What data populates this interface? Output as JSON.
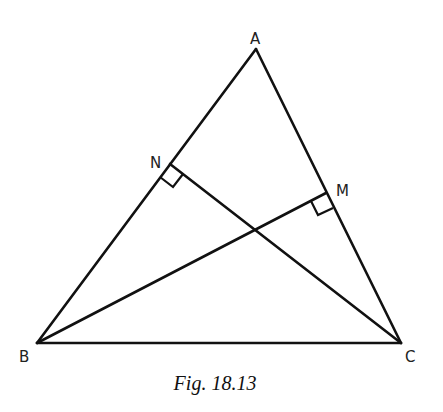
{
  "figure": {
    "caption": "Fig.  18.13",
    "vertices": {
      "A": {
        "label": "A",
        "x": 256,
        "y": 49,
        "lx": 250,
        "ly": 44
      },
      "B": {
        "label": "B",
        "x": 37,
        "y": 343,
        "lx": 19,
        "ly": 362
      },
      "C": {
        "label": "C",
        "x": 401,
        "y": 343,
        "lx": 405,
        "ly": 362
      },
      "N": {
        "label": "N",
        "x": 170,
        "y": 164,
        "lx": 150,
        "ly": 168
      },
      "M": {
        "label": "M",
        "x": 326,
        "y": 193,
        "lx": 336,
        "ly": 196
      }
    },
    "segments": [
      {
        "name": "AB",
        "from": "A",
        "to": "B"
      },
      {
        "name": "AC",
        "from": "A",
        "to": "C"
      },
      {
        "name": "BC",
        "from": "B",
        "to": "C"
      },
      {
        "name": "CN",
        "from": "C",
        "to": "N",
        "note": "altitude from C, perpendicular to AB"
      },
      {
        "name": "BM",
        "from": "B",
        "to": "M",
        "note": "altitude from B, perpendicular to AC"
      }
    ],
    "right_angles": [
      "N",
      "M"
    ],
    "intersection": {
      "x": 255,
      "y": 229
    },
    "stroke_color": "#111111"
  }
}
